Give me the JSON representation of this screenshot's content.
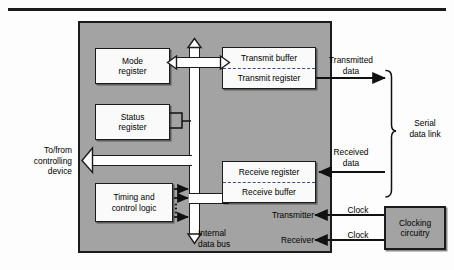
{
  "chip": {
    "label": "serial-interface-chip"
  },
  "registers": {
    "mode": {
      "line1": "Mode",
      "line2": "register"
    },
    "status": {
      "line1": "Status",
      "line2": "register"
    },
    "timing": {
      "line1": "Timing and",
      "line2": "control logic"
    },
    "transmit": {
      "top": "Transmit buffer",
      "bottom": "Transmit register"
    },
    "receive": {
      "top": "Receive register",
      "bottom": "Receive buffer"
    },
    "clocking": {
      "line1": "Clocking",
      "line2": "circuitry"
    }
  },
  "labels": {
    "internal_bus_l1": "Internal",
    "internal_bus_l2": "data bus",
    "host_l1": "To/from",
    "host_l2": "controlling",
    "host_l3": "device",
    "transmitted_l1": "Transmitted",
    "transmitted_l2": "data",
    "received_l1": "Received",
    "received_l2": "data",
    "serial_link_l1": "Serial",
    "serial_link_l2": "data link",
    "transmitter": "Transmitter",
    "receiver": "Receiver",
    "clock_tx": "Clock",
    "clock_rx": "Clock"
  },
  "colors": {
    "chip_fill": "#a3a3a3",
    "box_fill": "#fafafa",
    "stroke": "#1b1b1b",
    "dashed_divider": "#3a4f8a",
    "bus_fill": "#ffffff"
  }
}
